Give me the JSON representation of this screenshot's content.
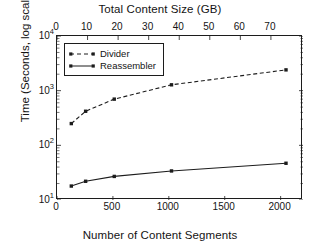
{
  "chart_data": {
    "type": "line",
    "title": "Total Content Size (GB)",
    "xlabel": "Number of Content Segments",
    "ylabel": "Time (Seconds, log scale)",
    "yscale": "log",
    "ylim": [
      10,
      10000
    ],
    "xlim": [
      0,
      2200
    ],
    "top_axis": {
      "label": "Total Content Size (GB)",
      "ticks": [
        0,
        10,
        20,
        30,
        40,
        50,
        60,
        70
      ],
      "tick_labels": [
        "0",
        "10",
        "20",
        "30",
        "40",
        "50",
        "60",
        "70"
      ],
      "max": 80.5
    },
    "bottom_axis": {
      "label": "Number of Content Segments",
      "ticks": [
        0,
        500,
        1000,
        1500,
        2000
      ],
      "tick_labels": [
        "0",
        "500",
        "1000",
        "1500",
        "2000"
      ]
    },
    "y_axis": {
      "ticks": [
        10,
        100,
        1000,
        10000
      ],
      "tick_labels": [
        "10",
        "10",
        "10",
        "10"
      ],
      "tick_exponents": [
        "1",
        "2",
        "3",
        "4"
      ]
    },
    "grid": false,
    "legend_position": "upper-left",
    "x": [
      128,
      256,
      512,
      1024,
      2048
    ],
    "series": [
      {
        "name": "Divider",
        "style": "dashed",
        "marker": "square",
        "color": "#1c1c1c",
        "values": [
          250,
          420,
          700,
          1280,
          2400
        ]
      },
      {
        "name": "Reassembler",
        "style": "solid",
        "marker": "square",
        "color": "#1c1c1c",
        "values": [
          18,
          22,
          27,
          34,
          47
        ]
      }
    ]
  },
  "legend": {
    "items": [
      {
        "label": "Divider"
      },
      {
        "label": "Reassembler"
      }
    ]
  },
  "colors": {
    "axis": "#1c1c1c",
    "text": "#141414",
    "background": "#ffffff",
    "series": "#1c1c1c"
  }
}
